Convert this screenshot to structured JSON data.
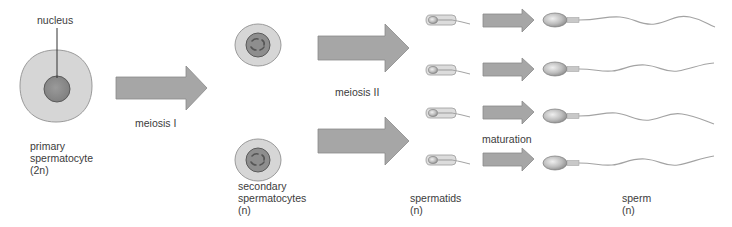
{
  "diagram": {
    "colors": {
      "cell_fill": "#d6d6d6",
      "cell_stroke": "#9a9a9a",
      "nucleus_fill": "#8e8e8e",
      "nucleus_stroke": "#5a5a5a",
      "chromosome": "#6a6a6a",
      "arrow_fill": "#a6a6a6",
      "arrow_stroke": "#8a8a8a",
      "tail": "#a3a3a3",
      "text": "#3c3c3c"
    },
    "stages": [
      {
        "id": "primary",
        "label_line1": "primary",
        "label_line2": "spermatocyte",
        "label_line3": "(2n)",
        "count": 1
      },
      {
        "id": "secondary",
        "label_line1": "secondary",
        "label_line2": "spermatocytes",
        "label_line3": "(n)",
        "count": 2
      },
      {
        "id": "spermatids",
        "label_line1": "spermatids",
        "label_line2": "(n)",
        "count": 4
      },
      {
        "id": "sperm",
        "label_line1": "sperm",
        "label_line2": "(n)",
        "count": 4
      }
    ],
    "callouts": {
      "nucleus": "nucleus"
    },
    "transitions": {
      "meiosis_1": "meiosis I",
      "meiosis_2": "meiosis II",
      "maturation": "maturation"
    }
  }
}
